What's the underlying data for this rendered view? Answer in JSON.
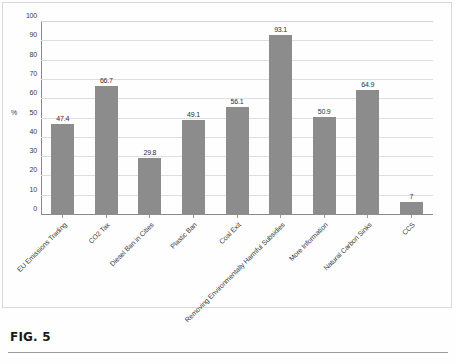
{
  "figure": {
    "caption": "FIG. 5"
  },
  "chart_data": {
    "type": "bar",
    "title": "",
    "xlabel": "",
    "ylabel": "%",
    "ylim": [
      0,
      100
    ],
    "ytick_step": 10,
    "grid": true,
    "legend": "none",
    "bar_color": "#8c8c8c",
    "categories": [
      "EU Emissions Trading",
      "CO2 Tax",
      "Diesel Ban in Cities",
      "Plastic Ban",
      "Coal Exit",
      "Removing Environmentally Harmful Subsidies",
      "More Information",
      "Natural Carbon Sinks",
      "CCS"
    ],
    "values": [
      47.4,
      66.7,
      29.8,
      49.1,
      56.1,
      93.1,
      50.9,
      64.9,
      7
    ],
    "value_labels": [
      "47.4",
      "66.7",
      "29.8",
      "49.1",
      "56.1",
      "93.1",
      "50.9",
      "64.9",
      "7"
    ],
    "yticks": [
      100,
      90,
      80,
      70,
      60,
      50,
      40,
      30,
      20,
      10,
      0
    ]
  }
}
